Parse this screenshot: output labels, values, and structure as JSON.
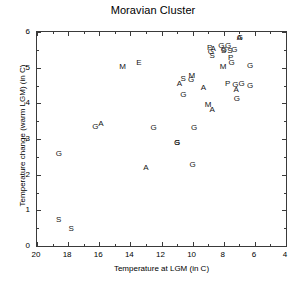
{
  "chart_data": {
    "type": "scatter",
    "title": "Moravian Cluster",
    "xlabel": "Temperature at LGM (in C)",
    "ylabel": "Temperature change (warm  LGM) (in C)",
    "xlim": [
      20,
      4
    ],
    "ylim": [
      0,
      6
    ],
    "x_reversed": true,
    "grid": false,
    "legend": null,
    "xticks": [
      20,
      18,
      16,
      14,
      12,
      10,
      8,
      6,
      4
    ],
    "xtick_labels": [
      "20",
      "18",
      "16",
      "14",
      "12",
      "10",
      "8",
      "6",
      "4"
    ],
    "xminor_ticks": [
      19,
      17,
      15,
      13,
      11,
      9,
      7,
      5
    ],
    "yticks": [
      0,
      1,
      2,
      3,
      4,
      5,
      6
    ],
    "ytick_labels": [
      "0",
      "1",
      "2",
      "3",
      "4",
      "5",
      "6"
    ],
    "yminor_ticks": [
      0.5,
      1.5,
      2.5,
      3.5,
      4.5,
      5.5
    ],
    "marker_style": "text-letter",
    "points": [
      {
        "label": "S",
        "x": 18.6,
        "y": 0.72
      },
      {
        "label": "S",
        "x": 17.8,
        "y": 0.48
      },
      {
        "label": "G",
        "x": 18.6,
        "y": 2.57
      },
      {
        "label": "G",
        "x": 16.25,
        "y": 3.33
      },
      {
        "label": "A",
        "x": 15.9,
        "y": 3.42
      },
      {
        "label": "M",
        "x": 14.5,
        "y": 5.02
      },
      {
        "label": "E",
        "x": 13.45,
        "y": 5.13
      },
      {
        "label": "A",
        "x": 13.0,
        "y": 2.2
      },
      {
        "label": "G",
        "x": 12.5,
        "y": 3.3
      },
      {
        "label": "G",
        "x": 11.0,
        "y": 2.9
      },
      {
        "label": "S",
        "x": 11.0,
        "y": 2.88
      },
      {
        "label": "A",
        "x": 10.85,
        "y": 4.55
      },
      {
        "label": "S",
        "x": 10.6,
        "y": 4.67
      },
      {
        "label": "M",
        "x": 10.05,
        "y": 4.78
      },
      {
        "label": "G",
        "x": 10.1,
        "y": 4.65
      },
      {
        "label": "G",
        "x": 10.6,
        "y": 4.22
      },
      {
        "label": "G",
        "x": 10.0,
        "y": 2.28
      },
      {
        "label": "G",
        "x": 9.9,
        "y": 3.3
      },
      {
        "label": "A",
        "x": 9.3,
        "y": 4.44
      },
      {
        "label": "M",
        "x": 9.0,
        "y": 3.95
      },
      {
        "label": "A",
        "x": 8.75,
        "y": 3.82
      },
      {
        "label": "P",
        "x": 8.9,
        "y": 5.56
      },
      {
        "label": "A",
        "x": 8.68,
        "y": 5.52
      },
      {
        "label": "G",
        "x": 8.82,
        "y": 5.43
      },
      {
        "label": "S",
        "x": 8.75,
        "y": 5.33
      },
      {
        "label": "G",
        "x": 8.15,
        "y": 5.62
      },
      {
        "label": "G",
        "x": 8.0,
        "y": 5.5
      },
      {
        "label": "S",
        "x": 8.0,
        "y": 5.48
      },
      {
        "label": "G",
        "x": 7.72,
        "y": 5.62
      },
      {
        "label": "S",
        "x": 7.6,
        "y": 5.48
      },
      {
        "label": "P",
        "x": 7.55,
        "y": 5.28
      },
      {
        "label": "G",
        "x": 7.5,
        "y": 5.13
      },
      {
        "label": "G",
        "x": 7.32,
        "y": 5.5
      },
      {
        "label": "A",
        "x": 7.0,
        "y": 5.84
      },
      {
        "label": "G",
        "x": 6.96,
        "y": 5.82
      },
      {
        "label": "M",
        "x": 8.05,
        "y": 5.02
      },
      {
        "label": "P",
        "x": 7.75,
        "y": 4.55
      },
      {
        "label": "G",
        "x": 7.25,
        "y": 4.52
      },
      {
        "label": "A",
        "x": 7.2,
        "y": 4.38
      },
      {
        "label": "G",
        "x": 7.15,
        "y": 4.12
      },
      {
        "label": "G",
        "x": 6.85,
        "y": 4.55
      },
      {
        "label": "G",
        "x": 6.3,
        "y": 5.06
      },
      {
        "label": "G",
        "x": 6.3,
        "y": 4.48
      }
    ]
  }
}
